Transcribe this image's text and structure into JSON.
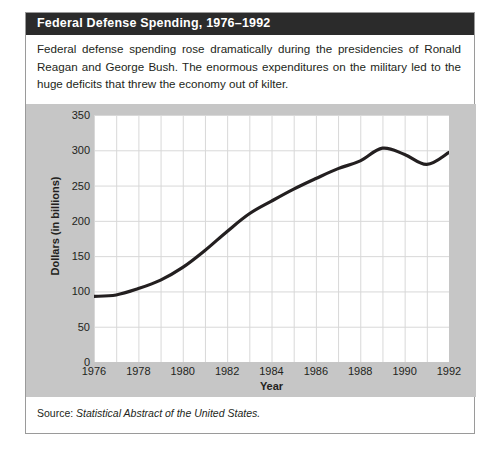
{
  "figure": {
    "title": "Federal Defense Spending, 1976–1992",
    "description": "Federal defense spending rose dramatically during the presidencies of Ronald Reagan and George Bush. The enormous expenditures on the military led to the huge deficits that threw the economy out of kilter.",
    "source_label": "Source:",
    "source_title": "Statistical Abstract of the United States.",
    "colors": {
      "title_bar": "#2b2b2b",
      "title_text": "#ffffff",
      "panel_background": "#c6c6c6",
      "plot_background": "#ffffff",
      "line": "#231f20",
      "grid": "#d8d8d8",
      "border": "#9a9a9a"
    }
  },
  "chart_data": {
    "type": "line",
    "title": "Federal Defense Spending, 1976–1992",
    "xlabel": "Year",
    "ylabel": "Dollars (in billions)",
    "xlim": [
      1976,
      1992
    ],
    "ylim": [
      0,
      350
    ],
    "yticks": [
      0,
      50,
      100,
      150,
      200,
      250,
      300,
      350
    ],
    "ytick_labels": [
      "0",
      "50",
      "100",
      "150",
      "200",
      "250",
      "300",
      "350"
    ],
    "xticks": [
      1976,
      1978,
      1980,
      1982,
      1984,
      1986,
      1988,
      1990,
      1992
    ],
    "xtick_labels": [
      "1976",
      "1978",
      "1980",
      "1982",
      "1984",
      "1986",
      "1988",
      "1990",
      "1992"
    ],
    "x_gridline_step": 1,
    "grid": true,
    "legend": false,
    "series": [
      {
        "name": "Federal defense spending",
        "x": [
          1976,
          1977,
          1978,
          1979,
          1980,
          1981,
          1982,
          1983,
          1984,
          1985,
          1986,
          1987,
          1988,
          1989,
          1990,
          1991,
          1992
        ],
        "values": [
          93,
          95,
          104,
          116,
          134,
          158,
          185,
          210,
          228,
          245,
          260,
          274,
          285,
          303,
          294,
          280,
          297
        ]
      }
    ]
  }
}
